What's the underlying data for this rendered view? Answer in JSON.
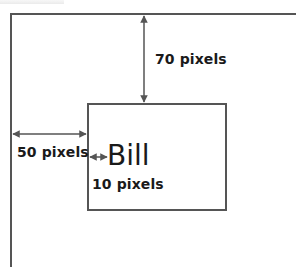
{
  "diagram": {
    "frame": {
      "description": "page/parent container edges (top and left)"
    },
    "box": {
      "text": "Bill",
      "left_offset_px": 50,
      "top_offset_px": 70,
      "padding_left_px": 10
    },
    "labels": {
      "top_offset": "70 pixels",
      "left_offset": "50 pixels",
      "padding_left": "10 pixels"
    },
    "colors": {
      "line": "#555555",
      "text": "#1a1a1a",
      "background": "#ffffff"
    }
  }
}
